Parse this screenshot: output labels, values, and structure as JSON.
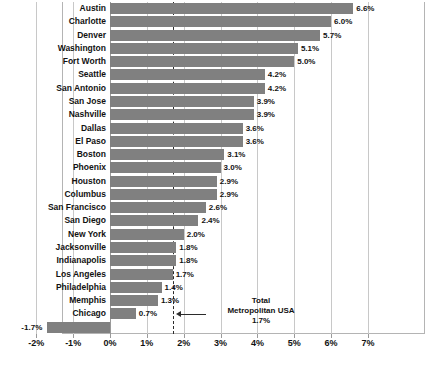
{
  "chart_data": {
    "type": "bar",
    "orientation": "horizontal",
    "title": "",
    "subtitle": "",
    "xlabel": "",
    "ylabel": "",
    "xlim": [
      -0.02,
      0.07
    ],
    "xtick_labels": [
      "-2%",
      "-1%",
      "0%",
      "1%",
      "2%",
      "3%",
      "4%",
      "5%",
      "6%",
      "7%"
    ],
    "xtick_values": [
      -2,
      -1,
      0,
      1,
      2,
      3,
      4,
      5,
      6,
      7
    ],
    "grid": true,
    "legend": false,
    "bar_color": "#808080",
    "reference_line": {
      "value": 1.7,
      "style": "dashed",
      "color": "#2b2b2b",
      "label_lines": [
        "Total",
        "Metropolitan USA",
        "1.7%"
      ]
    },
    "categories": [
      "Austin",
      "Charlotte",
      "Denver",
      "Washington",
      "Fort Worth",
      "Seattle",
      "San Antonio",
      "San Jose",
      "Nashville",
      "Dallas",
      "El Paso",
      "Boston",
      "Phoenix",
      "Houston",
      "Columbus",
      "San Francisco",
      "San Diego",
      "New York",
      "Jacksonville",
      "Indianapolis",
      "Los Angeles",
      "Philadelphia",
      "Memphis",
      "Chicago",
      "Detroit"
    ],
    "values": [
      6.6,
      6.0,
      5.7,
      5.1,
      5.0,
      4.2,
      4.2,
      3.9,
      3.9,
      3.6,
      3.6,
      3.1,
      3.0,
      2.9,
      2.9,
      2.6,
      2.4,
      2.0,
      1.8,
      1.8,
      1.7,
      1.4,
      1.3,
      0.7,
      -1.7
    ],
    "value_labels": [
      "6.6%",
      "6.0%",
      "5.7%",
      "5.1%",
      "5.0%",
      "4.2%",
      "4.2%",
      "3.9%",
      "3.9%",
      "3.6%",
      "3.6%",
      "3.1%",
      "3.0%",
      "2.9%",
      "2.9%",
      "2.6%",
      "2.4%",
      "2.0%",
      "1.8%",
      "1.8%",
      "1.7%",
      "1.4%",
      "1.3%",
      "0.7%",
      "-1.7%"
    ]
  }
}
